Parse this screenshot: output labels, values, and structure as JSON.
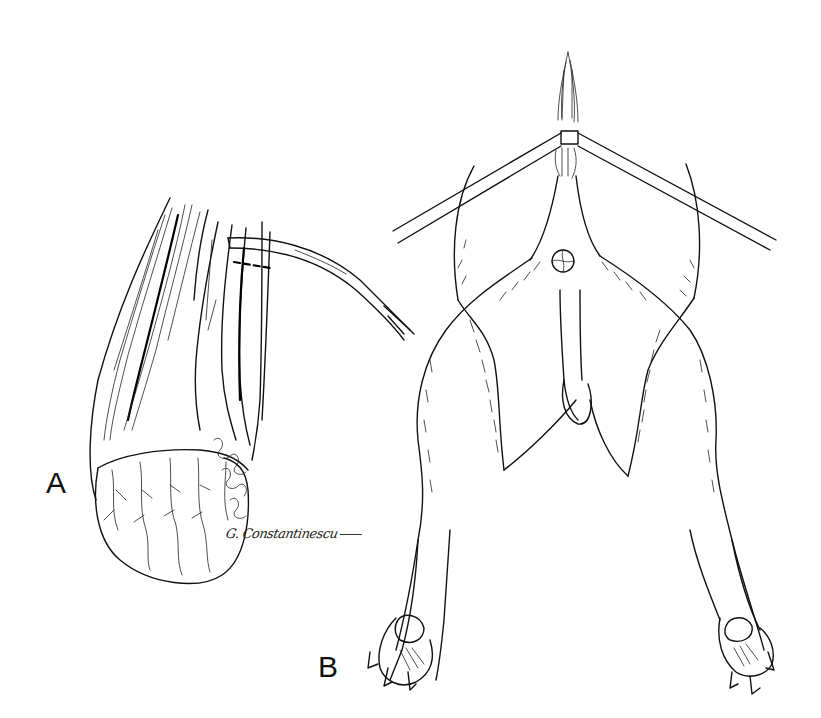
{
  "figure": {
    "panels": [
      {
        "id": "A",
        "label": "A",
        "description": "Close-up of scrotal region with forceps/instrument inserted along incision; testis with vascular pattern exposed"
      },
      {
        "id": "B",
        "label": "B",
        "description": "Animal in dorsal recumbency, hind limbs spread, tail tied with cord to two restraint ropes; perineal/scrotal area exposed"
      }
    ],
    "signature": "G. Constantinescu",
    "colors": {
      "ink": "#111111",
      "background": "#ffffff"
    }
  }
}
